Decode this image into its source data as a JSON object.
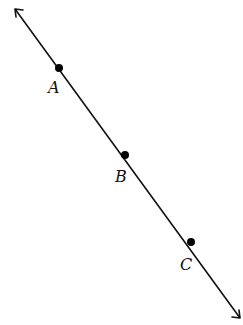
{
  "diagram": {
    "type": "geometry-line",
    "colors": {
      "line": "#111111",
      "background": "#ffffff"
    },
    "line": {
      "start": [
        15,
        9
      ],
      "end": [
        240,
        318
      ],
      "arrows": "both"
    },
    "points": [
      {
        "label": "A",
        "x": 59,
        "y": 68,
        "label_x": 49,
        "label_y": 93
      },
      {
        "label": "B",
        "x": 125,
        "y": 155,
        "label_x": 116,
        "label_y": 182
      },
      {
        "label": "C",
        "x": 191,
        "y": 242,
        "label_x": 181,
        "label_y": 270
      }
    ]
  }
}
